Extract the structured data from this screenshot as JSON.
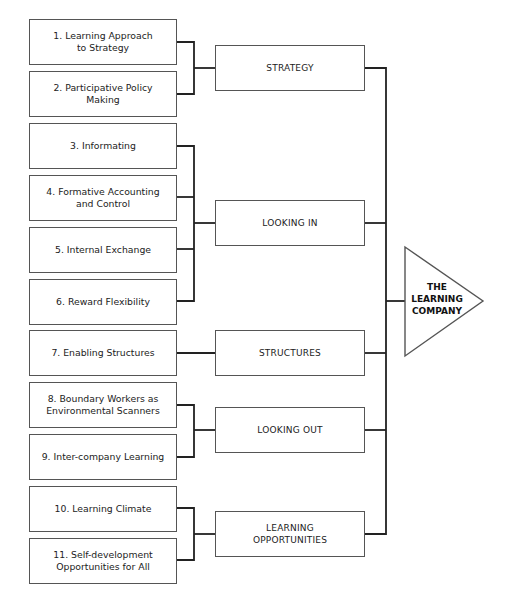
{
  "diagram": {
    "type": "hierarchy",
    "target": {
      "label": "THE\nLEARNING\nCOMPANY",
      "shape": "triangle"
    },
    "groups": [
      {
        "label": "STRATEGY",
        "items": [
          {
            "label": "1. Learning Approach\nto Strategy"
          },
          {
            "label": "2. Participative Policy\nMaking"
          }
        ]
      },
      {
        "label": "LOOKING IN",
        "items": [
          {
            "label": "3. Informating"
          },
          {
            "label": "4. Formative Accounting\nand Control"
          },
          {
            "label": "5. Internal Exchange"
          },
          {
            "label": "6. Reward Flexibility"
          }
        ]
      },
      {
        "label": "STRUCTURES",
        "items": [
          {
            "label": "7. Enabling Structures"
          }
        ]
      },
      {
        "label": "LOOKING OUT",
        "items": [
          {
            "label": "8. Boundary Workers as\nEnvironmental Scanners"
          },
          {
            "label": "9. Inter-company Learning"
          }
        ]
      },
      {
        "label": "LEARNING\nOPPORTUNITIES",
        "items": [
          {
            "label": "10. Learning Climate"
          },
          {
            "label": "11. Self-development\nOpportunities for All"
          }
        ]
      }
    ]
  },
  "colors": {
    "box_border": "#555555",
    "connector": "#222222",
    "background": "#ffffff"
  }
}
